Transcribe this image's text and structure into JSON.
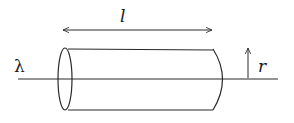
{
  "diagram": {
    "labels": {
      "line_charge": "λ",
      "length": "l",
      "radius": "r"
    },
    "colors": {
      "stroke": "#2a2a2a",
      "background": "#ffffff"
    }
  }
}
